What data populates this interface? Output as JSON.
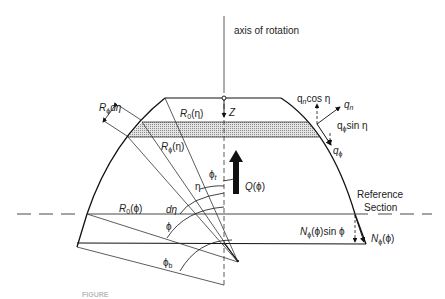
{
  "diagram": {
    "axis_label": "axis of rotation",
    "labels": {
      "R0_eta": "R0(η)",
      "R0_eta_main": "R",
      "R0_eta_sub": "0",
      "R0_eta_arg": "(η)",
      "Rphi_deta_main": "R",
      "Rphi_deta_sub": "ϕ",
      "Rphi_deta_arg": "dη",
      "Rphi_eta_main": "R",
      "Rphi_eta_sub": "ϕ",
      "Rphi_eta_arg": "(η)",
      "Z": "Z",
      "Q_main": "Q",
      "Q_arg": "(ϕ)",
      "phi_t_main": "ϕ",
      "phi_t_sub": "t",
      "eta": "η",
      "d_eta": "dη",
      "R0_phi_main": "R",
      "R0_phi_sub": "0",
      "R0_phi_arg": "(ϕ)",
      "phi": "ϕ",
      "phi_b_main": "ϕ",
      "phi_b_sub": "b",
      "qn_cos_main": "q",
      "qn_cos_sub": "n",
      "qn_cos_arg": "cos η",
      "qn_main": "q",
      "qn_sub": "n",
      "qphi_sin_main": "q",
      "qphi_sin_sub": "ϕ",
      "qphi_sin_arg": "sin η",
      "qphi_main": "q",
      "qphi_sub": "ϕ",
      "reference_line1": "Reference",
      "reference_line2": "Section",
      "N_sin_main": "N",
      "N_sin_sub": "ϕ",
      "N_sin_arg": "(ϕ)sin ϕ",
      "N_main": "N",
      "N_sub": "ϕ",
      "N_arg": "(ϕ)"
    },
    "caption": "FIGURE"
  }
}
